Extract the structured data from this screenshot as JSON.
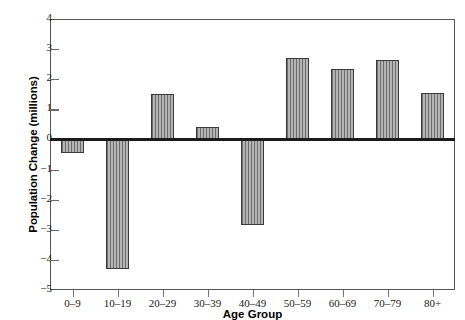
{
  "chart_data": {
    "type": "bar",
    "title": "",
    "xlabel": "Age Group",
    "ylabel": "Population Change (millions)",
    "categories": [
      "0–9",
      "10–19",
      "20–29",
      "30–39",
      "40–49",
      "50–59",
      "60–69",
      "70–79",
      "80+"
    ],
    "values": [
      -0.45,
      -4.3,
      1.5,
      0.4,
      -2.85,
      2.7,
      2.35,
      2.65,
      1.55
    ],
    "ylim": [
      -5,
      4
    ],
    "yticks": [
      4,
      3,
      2,
      1,
      0,
      -1,
      -2,
      -3,
      -4,
      -5
    ],
    "ytick_labels": [
      "4",
      "3",
      "2",
      "1",
      "0",
      "−1",
      "−2",
      "−3",
      "−4",
      "−5"
    ],
    "grid": false,
    "legend": null,
    "bar_fill": "#9a9a9a",
    "bar_edge": "#3a3a3a",
    "axis_color": "#555555",
    "zero_line_color": "#1b1b1b"
  }
}
